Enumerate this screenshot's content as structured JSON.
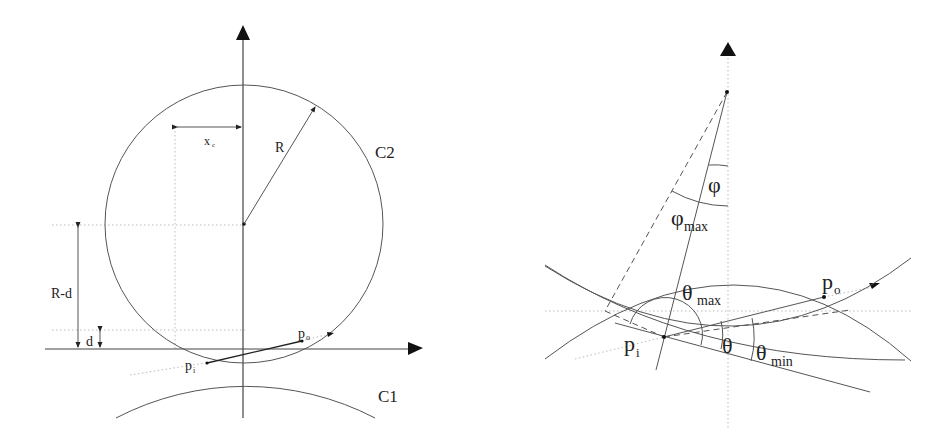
{
  "left_panel": {
    "labels": {
      "xc": "x",
      "xc_sub": "c",
      "R": "R",
      "C2": "C2",
      "C1": "C1",
      "R_minus_d": "R-d",
      "d": "d",
      "po": "p",
      "po_sub": "o",
      "pi": "p",
      "pi_sub": "i"
    },
    "circles": [
      {
        "name": "C2",
        "cx": 244,
        "cy": 224,
        "r": 139
      },
      {
        "name": "C1",
        "cx": 245,
        "cy": 610,
        "r": 281
      }
    ]
  },
  "right_panel": {
    "labels": {
      "phi": "φ",
      "phi_max": "φ",
      "phi_max_sub": "max",
      "theta_max": "θ",
      "theta_max_sub": "max",
      "theta": "θ",
      "theta_min": "θ",
      "theta_min_sub": "min",
      "po": "p",
      "po_sub": "o",
      "pi": "p",
      "pi_sub": "i"
    }
  },
  "colors": {
    "line": "#555555",
    "axis": "#444444",
    "dotted": "#bbbbbb",
    "text": "#222222"
  }
}
